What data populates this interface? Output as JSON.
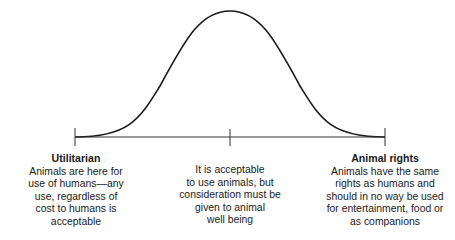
{
  "diagram": {
    "type": "bell-curve-spectrum",
    "line_color": "#1a1a1a",
    "axis": {
      "ticks": [
        "left",
        "center",
        "right"
      ]
    },
    "positions": [
      {
        "id": "left",
        "title": "Utilitarian",
        "text": "Animals are here for\nuse of humans—any\nuse, regardless of\ncost to humans is\nacceptable"
      },
      {
        "id": "center",
        "title": "",
        "text": "It is acceptable\nto use animals, but\nconsideration must be\ngiven to animal\nwell being"
      },
      {
        "id": "right",
        "title": "Animal rights",
        "text": "Animals have the same\nrights as humans and\nshould in no way be used\nfor entertainment, food or\nas companions"
      }
    ]
  }
}
